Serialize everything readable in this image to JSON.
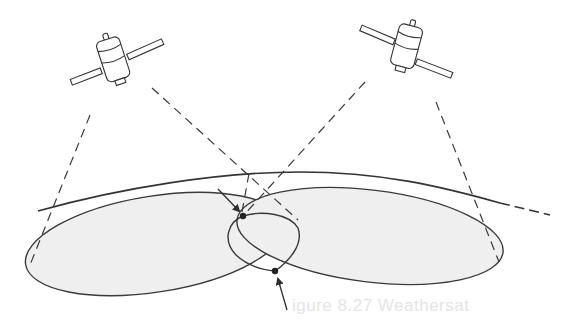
{
  "figure": {
    "bleed_through_caption": "igure 8.27  Weathersat",
    "colors": {
      "background": "#ffffff",
      "line": "#3a3a3a",
      "footprint_fill": "#efefef",
      "bleed_text": "#e4e4e4"
    },
    "elements": {
      "satellites": [
        {
          "id": "left",
          "position": [
            115,
            65
          ]
        },
        {
          "id": "right",
          "position": [
            405,
            50
          ]
        }
      ],
      "footprints": [
        {
          "id": "left-footprint"
        },
        {
          "id": "right-footprint"
        }
      ],
      "intersection_points": [
        {
          "id": "upper",
          "position": [
            243,
            216
          ]
        },
        {
          "id": "lower",
          "position": [
            275,
            271
          ]
        }
      ]
    }
  }
}
